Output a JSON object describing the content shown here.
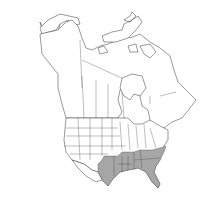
{
  "map": {
    "region": "North America",
    "highlight_color": "#a6a6a6",
    "outline_color": "#333333",
    "background_color": "#ffffff",
    "shaded_regions": [
      "Texas",
      "Oklahoma",
      "Arkansas",
      "Louisiana",
      "Mississippi",
      "Alabama",
      "Georgia",
      "Florida",
      "South Carolina",
      "North Carolina",
      "Tennessee"
    ]
  }
}
